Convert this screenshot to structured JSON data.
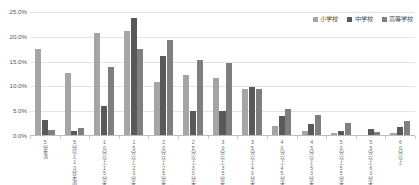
{
  "chart_data": {
    "type": "bar",
    "title": "",
    "subtitle": "",
    "xlabel": "",
    "ylabel": "",
    "ylim": [
      0,
      25
    ],
    "ytick_labels": [
      "0.0%",
      "5.0%",
      "10.0%",
      "15.0%",
      "20.0%",
      "25.0%"
    ],
    "ytick_values": [
      0,
      5,
      10,
      15,
      20,
      25
    ],
    "grid": true,
    "legend_position": "top-right",
    "categories": [
      "5分未満",
      "5分以上10分未満",
      "10分以上15分未満",
      "15分以上20分未満",
      "20分以上25分未満",
      "25分以上30分未満",
      "30分以上35分未満",
      "35分以上40分未満",
      "40分以上45分未満",
      "45分以上50分未満",
      "50分以上55分未満",
      "55分以上60分未満",
      "60分以上"
    ],
    "series": [
      {
        "name": "小学校",
        "color": "#a5a5a5",
        "values": [
          17.6,
          12.8,
          20.7,
          21.1,
          10.9,
          12.3,
          11.7,
          9.4,
          2.1,
          1.0,
          0.6,
          0.3,
          0.7
        ]
      },
      {
        "name": "中学校",
        "color": "#595959",
        "values": [
          3.2,
          1.0,
          6.0,
          23.8,
          16.2,
          5.0,
          5.1,
          9.8,
          4.1,
          2.5,
          1.1,
          1.5,
          1.9
        ]
      },
      {
        "name": "高等学校",
        "color": "#7f7f7f",
        "values": [
          1.2,
          1.6,
          14.0,
          17.5,
          19.3,
          15.4,
          14.7,
          9.5,
          5.4,
          4.2,
          2.6,
          0.9,
          3.1
        ]
      }
    ]
  },
  "legend": {
    "items": [
      {
        "label": "小学校",
        "color": "#a5a5a5"
      },
      {
        "label": "中学校",
        "color": "#595959"
      },
      {
        "label": "高等学校",
        "color": "#7f7f7f"
      }
    ]
  },
  "colors": {
    "background": "#ffffff",
    "gridline": "#e3e3e3",
    "axis": "#bdbdbd",
    "tick_text": "#59595c",
    "legend_text": "#4a4a4a"
  }
}
